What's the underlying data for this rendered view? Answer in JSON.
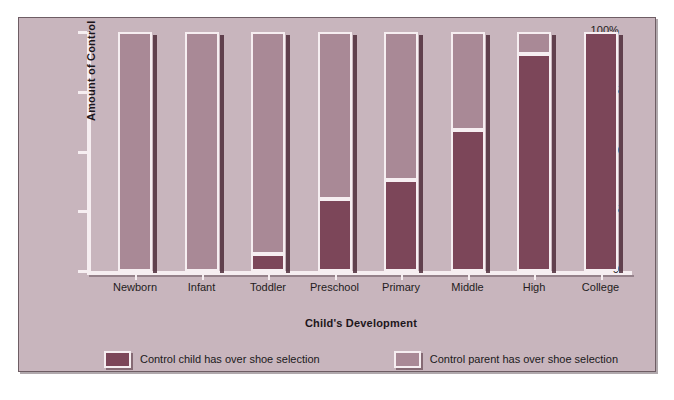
{
  "chart_data": {
    "type": "bar",
    "title": "",
    "subtitle": "",
    "xlabel": "Child's Development",
    "ylabel": "Amount of Control",
    "stacked": true,
    "stack_total": 100,
    "grid": false,
    "legend_position": "bottom",
    "ylim": [
      0,
      100
    ],
    "ytick_labels": [
      "100%",
      "75",
      "50",
      "25",
      "0"
    ],
    "ytick_values": [
      100,
      75,
      50,
      25,
      0
    ],
    "categories": [
      "Newborn",
      "Infant",
      "Toddler",
      "Preschool",
      "Primary",
      "Middle",
      "High",
      "College"
    ],
    "series": [
      {
        "name": "Control child has over shoe selection",
        "color": "#7c4659",
        "values": [
          0,
          0,
          7,
          30,
          38,
          59,
          91,
          100
        ]
      },
      {
        "name": "Control parent has over shoe selection",
        "color": "#a98996",
        "values": [
          100,
          100,
          93,
          70,
          62,
          41,
          9,
          0
        ]
      }
    ]
  },
  "axes": {
    "y_title": "Amount of Control",
    "x_title": "Child's Development",
    "y_ticks": [
      {
        "label": "100%",
        "value": 100
      },
      {
        "label": "75",
        "value": 75
      },
      {
        "label": "50",
        "value": 50
      },
      {
        "label": "25",
        "value": 25
      },
      {
        "label": "0",
        "value": 0
      }
    ]
  },
  "legend": {
    "items": [
      {
        "label": "Control child has over shoe selection",
        "color": "#7c4659"
      },
      {
        "label": "Control parent has over shoe selection",
        "color": "#a98996"
      }
    ]
  },
  "colors": {
    "panel_background": "#c8b5bd",
    "page_background": "#ffffff",
    "child_segment": "#7c4659",
    "parent_segment": "#a98996",
    "outline": "#f6eef1",
    "shadow": "#4e2c39",
    "text": "#1d161b"
  },
  "caption": ""
}
